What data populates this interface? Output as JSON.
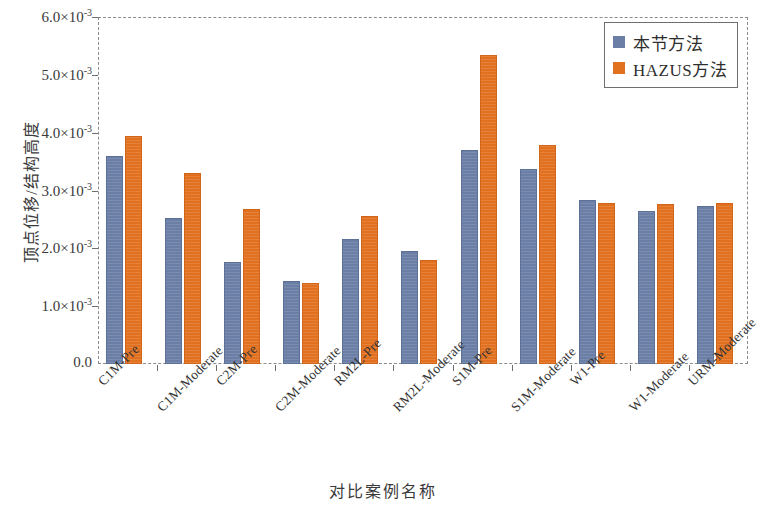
{
  "chart_data": {
    "type": "bar",
    "title": "",
    "xlabel": "对比案例名称",
    "ylabel": "顶点位移/结构高度",
    "categories": [
      "C1M-Pre",
      "C1M-Moderate",
      "C2M-Pre",
      "C2M-Moderate",
      "RM2L-Pre",
      "RM2L-Moderate",
      "S1M-Pre",
      "S1M-Moderate",
      "W1-Pre",
      "W1-Moderate",
      "URM-Moderate"
    ],
    "series": [
      {
        "name": "本节方法",
        "color": "#6b7fa6",
        "values": [
          0.0036,
          0.00252,
          0.00177,
          0.00143,
          0.00217,
          0.00195,
          0.0037,
          0.00337,
          0.00283,
          0.00265,
          0.00273
        ]
      },
      {
        "name": "HAZUS方法",
        "color": "#e1701f",
        "values": [
          0.00394,
          0.0033,
          0.00268,
          0.0014,
          0.00256,
          0.0018,
          0.00535,
          0.00379,
          0.00279,
          0.00276,
          0.00278
        ]
      }
    ],
    "ylim": [
      0,
      0.006
    ],
    "yticks": [
      0,
      0.001,
      0.002,
      0.003,
      0.004,
      0.005,
      0.006
    ],
    "ytick_labels": [
      "0.0",
      "1.0×10",
      "2.0×10",
      "3.0×10",
      "4.0×10",
      "5.0×10",
      "6.0×10"
    ],
    "ytick_exponents": [
      "",
      "-3",
      "-3",
      "-3",
      "-3",
      "-3",
      "-3"
    ],
    "grid": false,
    "legend_position": "top-right"
  },
  "legend": {
    "items": [
      {
        "label": "本节方法",
        "color": "#6b7fa6"
      },
      {
        "label": "HAZUS方法",
        "color": "#e1701f"
      }
    ]
  },
  "axes": {
    "y_title": "顶点位移/结构高度",
    "x_title": "对比案例名称"
  }
}
